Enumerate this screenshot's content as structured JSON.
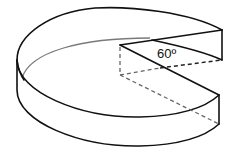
{
  "figure": {
    "angle_label": "60º",
    "angle_degrees": 60,
    "colors": {
      "stroke": "#111111",
      "hidden_edge": "#7a7a7a",
      "background": "#ffffff"
    }
  }
}
